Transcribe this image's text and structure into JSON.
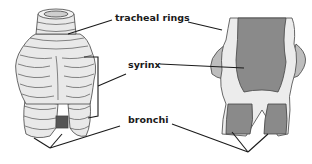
{
  "diagram": {
    "type": "anatomical illustration",
    "views": [
      "external view",
      "cross-section view"
    ],
    "labels": {
      "tracheal_rings": "tracheal rings",
      "syrinx": "syrinx",
      "bronchi": "bronchi"
    },
    "colors": {
      "outline": "#333333",
      "exterior_fill": "#e8e8e8",
      "interior_fill": "#8a8a8a",
      "leader_lines": "#1a1a1a"
    }
  }
}
